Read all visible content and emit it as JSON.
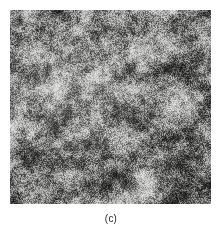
{
  "figure": {
    "caption": "(c)",
    "panel_label": "c",
    "alt_description": "grayscale micrograph",
    "background_color": "#ffffff",
    "caption_color": "#2a2a2a"
  },
  "micrograph": {
    "name": "two-phase-microstructure-micrograph",
    "left": 10,
    "top": 10,
    "width": 201,
    "height": 194,
    "dark_color": "#0d0d0d",
    "light_color": "#e8e8e6",
    "mid_color": "#8a8a88",
    "base_color": "#cfcfcf"
  },
  "chart_data": {
    "type": "heatmap",
    "title": "(c)",
    "xlabel": "",
    "ylabel": "",
    "grid": false,
    "legend": false,
    "colormap": "gray",
    "value_range": [
      0,
      255
    ],
    "grain_size_px": 1.5,
    "dark_fraction": 0.5,
    "light_fraction": 0.5,
    "rows": 194,
    "cols": 201,
    "noise_seed": 20240517
  }
}
